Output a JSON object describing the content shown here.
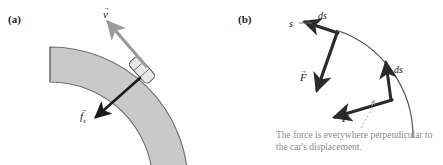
{
  "figure": {
    "panels": [
      {
        "id": "a",
        "label": "(a)",
        "description": "car-on-banked-curve",
        "annotations": {
          "velocity_vector": "v",
          "friction_vector": "f",
          "friction_subscript": "s",
          "arrow_overbar": "→"
        },
        "colors": {
          "road_fill": "#c9c9c9",
          "road_stroke": "#6e6e6e",
          "velocity_arrow": "#9a9a9a",
          "friction_arrow": "#1a1a1a",
          "car_fill": "#e8e8e8",
          "car_stroke": "#555555"
        }
      },
      {
        "id": "b",
        "label": "(b)",
        "description": "arc-with-displacement-and-force-vectors",
        "annotations": {
          "arc_label": "s",
          "displacement_1": "ds",
          "displacement_2": "ds",
          "force_1": "F",
          "force_2": "F",
          "arrow_overbar": "→"
        },
        "caption": "The force is everywhere perpendicular to the car's displacement.",
        "colors": {
          "arc_stroke": "#4a4a4a",
          "vector_stroke": "#2b2b2b",
          "leader_line": "#a9a9a9",
          "caption_text": "#8f8a86"
        }
      }
    ]
  }
}
